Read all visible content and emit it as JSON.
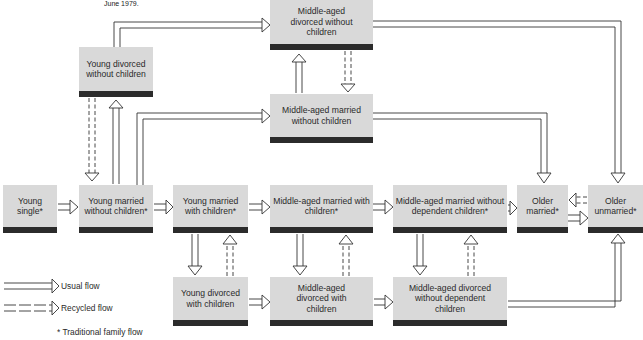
{
  "caption": "June 1979.",
  "colors": {
    "box_fill": "#d9d9d9",
    "box_bar": "#2b2b2b",
    "line": "#333333",
    "background": "#ffffff"
  },
  "nodes": {
    "young_single": "Young single*",
    "young_married_no_children": "Young married without children*",
    "young_married_with_children": "Young married with children*",
    "middle_married_with_children": "Middle-aged married with children*",
    "middle_married_no_dependent_children": "Middle-aged married without dependent children*",
    "older_married": "Older married*",
    "older_unmarried": "Older unmarried*",
    "young_divorced_no_children": "Young divorced without children",
    "middle_divorced_no_children": "Middle-aged divorced without children",
    "middle_married_no_children": "Middle-aged married without children",
    "young_divorced_with_children": "Young divorced with children",
    "middle_divorced_with_children": "Middle-aged divorced with children",
    "middle_divorced_no_dependent_children": "Middle-aged divorced without dependent children"
  },
  "legend": {
    "usual_flow": "Usual flow",
    "recycled_flow": "Recycled flow",
    "traditional_note": "* Traditional family flow"
  },
  "flows": [
    {
      "from": "Young single",
      "to": "Young married without children",
      "type": "usual"
    },
    {
      "from": "Young married without children",
      "to": "Young married with children",
      "type": "usual"
    },
    {
      "from": "Young married with children",
      "to": "Middle-aged married with children",
      "type": "usual"
    },
    {
      "from": "Middle-aged married with children",
      "to": "Middle-aged married without dependent children",
      "type": "usual"
    },
    {
      "from": "Middle-aged married without dependent children",
      "to": "Older married",
      "type": "usual"
    },
    {
      "from": "Older married",
      "to": "Older unmarried",
      "type": "usual"
    },
    {
      "from": "Older unmarried",
      "to": "Older married",
      "type": "recycled"
    },
    {
      "from": "Young married without children",
      "to": "Young divorced without children",
      "type": "usual"
    },
    {
      "from": "Young divorced without children",
      "to": "Young married without children",
      "type": "recycled"
    },
    {
      "from": "Young divorced without children",
      "to": "Middle-aged divorced without children",
      "type": "usual"
    },
    {
      "from": "Young married without children",
      "to": "Middle-aged married without children",
      "type": "usual"
    },
    {
      "from": "Middle-aged married without children",
      "to": "Middle-aged divorced without children",
      "type": "usual"
    },
    {
      "from": "Middle-aged divorced without children",
      "to": "Middle-aged married without children",
      "type": "recycled"
    },
    {
      "from": "Middle-aged divorced without children",
      "to": "Older unmarried",
      "type": "usual"
    },
    {
      "from": "Middle-aged married without children",
      "to": "Older married",
      "type": "usual"
    },
    {
      "from": "Young married with children",
      "to": "Young divorced with children",
      "type": "usual"
    },
    {
      "from": "Young divorced with children",
      "to": "Young married with children",
      "type": "recycled"
    },
    {
      "from": "Young divorced with children",
      "to": "Middle-aged divorced with children",
      "type": "usual"
    },
    {
      "from": "Middle-aged married with children",
      "to": "Middle-aged divorced with children",
      "type": "usual"
    },
    {
      "from": "Middle-aged divorced with children",
      "to": "Middle-aged married with children",
      "type": "recycled"
    },
    {
      "from": "Middle-aged divorced with children",
      "to": "Middle-aged divorced without dependent children",
      "type": "usual"
    },
    {
      "from": "Middle-aged married without dependent children",
      "to": "Middle-aged divorced without dependent children",
      "type": "usual"
    },
    {
      "from": "Middle-aged divorced without dependent children",
      "to": "Middle-aged married without dependent children",
      "type": "recycled"
    },
    {
      "from": "Middle-aged divorced without dependent children",
      "to": "Older unmarried",
      "type": "usual"
    }
  ]
}
